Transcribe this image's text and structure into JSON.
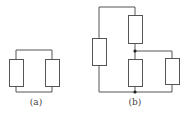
{
  "diagram": {
    "type": "circuit-schematics",
    "colors": {
      "line": "#555555",
      "dot": "#222222",
      "background": "#ffffff"
    },
    "circuits": [
      {
        "id": "a",
        "label": "(a)",
        "description": "Two resistors in parallel",
        "resistors": 2,
        "junctions": 0
      },
      {
        "id": "b",
        "label": "(b)",
        "description": "Network of four resistors with two junction nodes",
        "resistors": 4,
        "junctions": 2
      }
    ]
  }
}
